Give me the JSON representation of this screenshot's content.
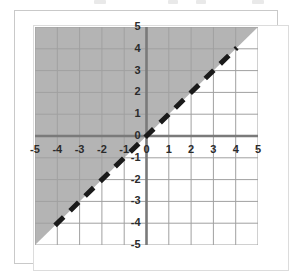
{
  "figure": {
    "kind": "coordinate-plane-graph",
    "background_color": "#ffffff",
    "frame_color": "#c9c9c9",
    "inner_frame_color": "#dcdcdc"
  },
  "chart_data": {
    "type": "line",
    "title": "",
    "xlabel": "",
    "ylabel": "",
    "xlim": [
      -5,
      5
    ],
    "ylim": [
      -5,
      5
    ],
    "grid": true,
    "grid_step": 1,
    "grid_color": "#a0a0a0",
    "axis_color": "#7a7a7a",
    "legend": "none",
    "x_ticks": [
      "-5",
      "-4",
      "-3",
      "-2",
      "-1",
      "0",
      "1",
      "2",
      "3",
      "4",
      "5"
    ],
    "y_ticks": [
      "5",
      "4",
      "3",
      "2",
      "1",
      "0",
      "-1",
      "-2",
      "-3",
      "-4",
      "-5"
    ],
    "x_tick_values": [
      -5,
      -4,
      -3,
      -2,
      -1,
      0,
      1,
      2,
      3,
      4,
      5
    ],
    "y_tick_values": [
      5,
      4,
      3,
      2,
      1,
      0,
      -1,
      -2,
      -3,
      -4,
      -5
    ],
    "series": [
      {
        "name": "boundary-line",
        "equation": "y = x",
        "slope": 1,
        "intercept": 0,
        "style": "dashed",
        "color": "#1a1a1a",
        "line_width": 5,
        "dash_pattern": "12 9",
        "x": [
          -4.1,
          4.05
        ],
        "values": [
          -4.1,
          4.05
        ],
        "endpoints": [
          [
            -4.1,
            -4.1
          ],
          [
            4.05,
            4.05
          ]
        ]
      }
    ],
    "shaded_region": {
      "name": "solution-region",
      "inequality": "y > x",
      "relation": "greater-than",
      "boundary_included": false,
      "fill_color": "#b4b4b4",
      "fill_opacity": 1,
      "polygon": [
        [
          -5,
          -5
        ],
        [
          5,
          5
        ],
        [
          5,
          5
        ],
        [
          -5,
          5
        ]
      ],
      "side": "above-left"
    }
  }
}
